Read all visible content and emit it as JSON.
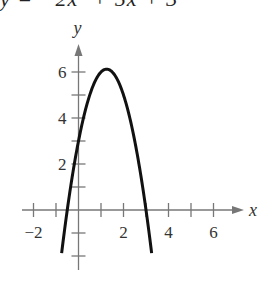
{
  "header": {
    "equation": "y = −2x² + 5x + 3"
  },
  "chart_data": {
    "type": "line",
    "title": "y = −2x² + 5x + 3",
    "xlabel": "x",
    "ylabel": "y",
    "xlim": [
      -2.5,
      7
    ],
    "ylim": [
      -2.5,
      7
    ],
    "x_ticks": [
      -2,
      -1,
      0,
      1,
      2,
      3,
      4,
      5,
      6
    ],
    "x_tick_labels": [
      "−2",
      "2",
      "4",
      "6"
    ],
    "y_ticks": [
      -2,
      -1,
      1,
      2,
      3,
      4,
      5,
      6
    ],
    "y_tick_labels": [
      "2",
      "4",
      "6"
    ],
    "grid": false,
    "series": [
      {
        "name": "y = -2x^2 + 5x + 3",
        "coefficients": {
          "a": -2,
          "b": 5,
          "c": 3
        },
        "vertex": [
          1.25,
          6.125
        ],
        "x_intercepts": [
          -0.5,
          3
        ],
        "y_intercept": 3,
        "x_range": [
          -0.75,
          3.25
        ]
      }
    ]
  },
  "colors": {
    "axis": "#777777",
    "curve": "#111111",
    "text": "#333333"
  }
}
